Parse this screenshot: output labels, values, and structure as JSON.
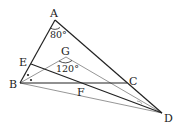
{
  "diagram": {
    "points": {
      "A": {
        "label": "A",
        "x": 55,
        "y": 20
      },
      "B": {
        "label": "B",
        "x": 20,
        "y": 83
      },
      "C": {
        "label": "C",
        "x": 127,
        "y": 83
      },
      "D": {
        "label": "D",
        "x": 162,
        "y": 113
      },
      "E": {
        "label": "E",
        "x": 31,
        "y": 64
      },
      "F": {
        "label": "F",
        "x": 83,
        "y": 83
      },
      "G": {
        "label": "G",
        "x": 66,
        "y": 57
      }
    },
    "angles": {
      "A": "80°",
      "G": "120°"
    },
    "colors": {
      "main_line": "#222222",
      "aux_line": "#8a8a8a"
    }
  }
}
